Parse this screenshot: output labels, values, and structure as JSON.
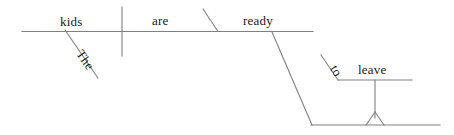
{
  "diagram": {
    "type": "reed-kellogg-sentence-diagram",
    "sentence": "The kids are ready to leave",
    "stroke_color": "#808080",
    "text_color": "#1a1a1a",
    "background_color": "#ffffff",
    "words": {
      "subject": "kids",
      "article": "The",
      "verb": "are",
      "predicate_adjective": "ready",
      "infinitive_marker": "to",
      "infinitive_verb": "leave"
    },
    "labels": [
      {
        "text": "kids",
        "role": "subject"
      },
      {
        "text": "The",
        "role": "article-modifier"
      },
      {
        "text": "are",
        "role": "linking-verb"
      },
      {
        "text": "ready",
        "role": "predicate-adjective"
      },
      {
        "text": "to",
        "role": "infinitive-marker"
      },
      {
        "text": "leave",
        "role": "infinitive-verb"
      }
    ]
  }
}
